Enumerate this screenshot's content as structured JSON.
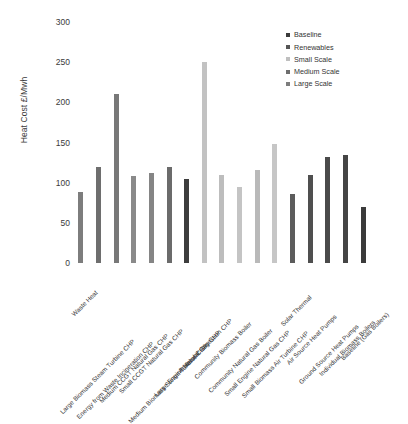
{
  "chart_data": {
    "type": "bar",
    "title": "",
    "subtitle": "",
    "xlabel": "",
    "ylabel": "Heat Cost £/Mwh",
    "ylim": [
      0,
      300
    ],
    "yticks": [
      0,
      50,
      100,
      150,
      200,
      250,
      300
    ],
    "ytick_labels": [
      "0",
      "50",
      "100",
      "150",
      "200",
      "250",
      "300"
    ],
    "grid": false,
    "legend_position": "top-right",
    "legend": [
      {
        "name": "Baseline",
        "color": "#3b3b3b"
      },
      {
        "name": "Renewables",
        "color": "#555555"
      },
      {
        "name": "Small Scale",
        "color": "#bfbfbf"
      },
      {
        "name": "Medium Scale",
        "color": "#6e6e6e"
      },
      {
        "name": "Large Scale",
        "color": "#7d7d7d"
      }
    ],
    "categories": [
      "Waste Heat",
      "Large Biomass Steam Turbine CHP",
      "Energy from Waste Incineration CHP",
      "Medium CCGT Natural Gas CHP",
      "Small CCGT Natural Gas CHP",
      "Medium Biomass Steam Turbine CHP",
      "Large Engine Natural Gas CHP",
      "Anaerobic Digestion CHP",
      "Community Biomass Boiler",
      "Community Natural Gas Boiler",
      "Small Engine Natural Gas CHP",
      "Small Biomass Air Turbine CHP",
      "Solar Thermal",
      "Air Source Heat Pumps",
      "Ground Source Heat Pumps",
      "Individual Biomass Boilers",
      "Baseline (Gas Boilers)"
    ],
    "values": [
      88,
      120,
      210,
      108,
      112,
      120,
      105,
      250,
      110,
      95,
      116,
      148,
      86,
      110,
      132,
      135,
      70
    ],
    "bar_colors": [
      "#7d7d7d",
      "#6e6e6e",
      "#787878",
      "#8a8a8a",
      "#858585",
      "#6b6b6b",
      "#3d3d3d",
      "#c2c2c2",
      "#bdbdbd",
      "#c4c4c4",
      "#b9b9b9",
      "#c6c6c6",
      "#5c5c5c",
      "#4f4f4f",
      "#4a4a4a",
      "#454545",
      "#3b3b3b"
    ],
    "series_of_bar": [
      "Large Scale",
      "Large Scale",
      "Large Scale",
      "Medium Scale",
      "Medium Scale",
      "Medium Scale",
      "Large Scale",
      "Small Scale",
      "Small Scale",
      "Small Scale",
      "Small Scale",
      "Small Scale",
      "Renewables",
      "Renewables",
      "Renewables",
      "Renewables",
      "Baseline"
    ]
  }
}
